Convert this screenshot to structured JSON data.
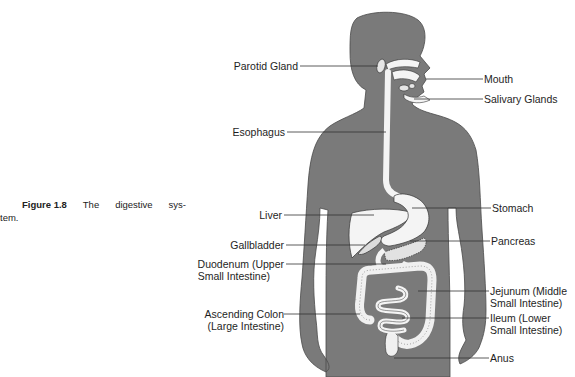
{
  "caption": {
    "figure_number": "Figure 1.8",
    "words": [
      "The",
      "digestive",
      "sys-"
    ],
    "continuation": "tem.",
    "full_text": "Figure 1.8 The digestive system."
  },
  "labels": {
    "left": [
      {
        "id": "parotid",
        "lines": [
          "Parotid Gland"
        ]
      },
      {
        "id": "esophagus",
        "lines": [
          "Esophagus"
        ]
      },
      {
        "id": "liver",
        "lines": [
          "Liver"
        ]
      },
      {
        "id": "gallbladder",
        "lines": [
          "Gallbladder"
        ]
      },
      {
        "id": "duodenum",
        "lines": [
          "Duodenum (Upper",
          "Small  Intestine)"
        ]
      },
      {
        "id": "ascending-colon",
        "lines": [
          "Ascending Colon",
          "(Large Intestine)"
        ]
      }
    ],
    "right": [
      {
        "id": "mouth",
        "lines": [
          "Mouth"
        ]
      },
      {
        "id": "salivary",
        "lines": [
          "Salivary Glands"
        ]
      },
      {
        "id": "stomach",
        "lines": [
          "Stomach"
        ]
      },
      {
        "id": "pancreas",
        "lines": [
          "Pancreas"
        ]
      },
      {
        "id": "jejunum",
        "lines": [
          "Jejunum (Middle",
          "Small Intestine)"
        ]
      },
      {
        "id": "ileum",
        "lines": [
          "Ileum (Lower",
          "Small Intestine)"
        ]
      },
      {
        "id": "anus",
        "lines": [
          "Anus"
        ]
      }
    ]
  },
  "colors": {
    "body": "#7a7a7a",
    "organ": "#f4f4f4",
    "leader_line": "#333333"
  }
}
